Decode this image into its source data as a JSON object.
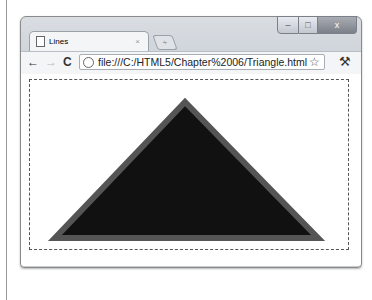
{
  "browser": {
    "tab": {
      "title": "Lines",
      "close": "×"
    },
    "new_tab": "+",
    "address": "file:///C:/HTML5/Chapter%2006/Triangle.html",
    "controls": {
      "minimize": "–",
      "maximize": "□",
      "close": "x"
    },
    "nav": {
      "back": "←",
      "forward": "→",
      "reload": "C"
    },
    "bookmark_icon": "☆",
    "wrench_icon": "🔧"
  },
  "canvas": {
    "shape": "triangle",
    "points": [
      [
        185,
        102
      ],
      [
        55,
        238
      ],
      [
        318,
        238
      ]
    ],
    "fill": "#111111",
    "stroke": "#555555",
    "stroke_width": 6
  }
}
